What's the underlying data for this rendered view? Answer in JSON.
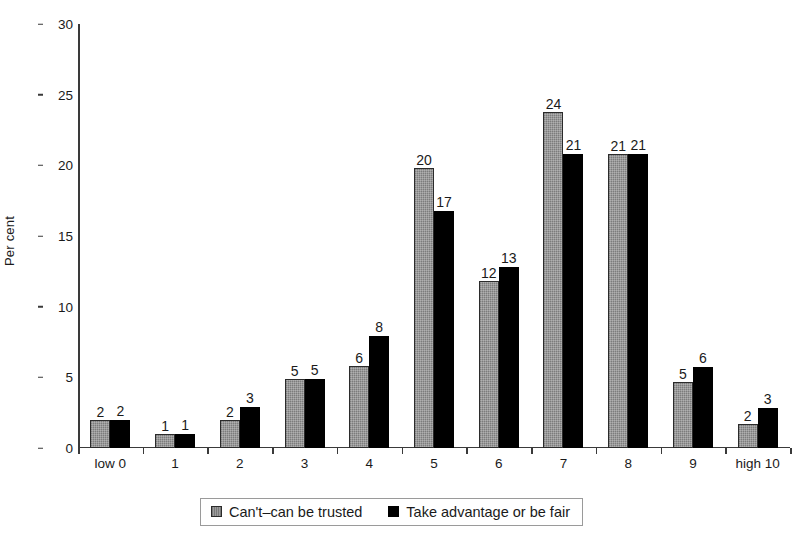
{
  "chart_data": {
    "type": "bar",
    "title": "",
    "subtitle": "",
    "xlabel": "",
    "ylabel": "Per cent",
    "categories": [
      "low 0",
      "1",
      "2",
      "3",
      "4",
      "5",
      "6",
      "7",
      "8",
      "9",
      "high 10"
    ],
    "series": [
      {
        "name": "Can't–can be trusted",
        "color": "#8e8e8e",
        "values": [
          2,
          1,
          2,
          5,
          6,
          20,
          12,
          24,
          21,
          5,
          2
        ],
        "plotted": [
          2.0,
          1.0,
          2.0,
          4.9,
          5.8,
          19.8,
          11.8,
          23.8,
          20.8,
          4.7,
          1.7
        ]
      },
      {
        "name": "Take advantage or be fair",
        "color": "#000000",
        "values": [
          2,
          1,
          3,
          5,
          8,
          17,
          13,
          21,
          21,
          6,
          3
        ],
        "plotted": [
          2.0,
          1.0,
          2.9,
          4.9,
          7.9,
          16.8,
          12.8,
          20.8,
          20.8,
          5.7,
          2.8
        ]
      }
    ],
    "ylim": [
      0,
      30
    ],
    "yticks": [
      0,
      5,
      10,
      15,
      20,
      25,
      30
    ],
    "ytick_labels": [
      "0",
      "5",
      "10",
      "15",
      "20",
      "25",
      "30"
    ],
    "grid": false,
    "legend_position": "bottom",
    "value_labels": true
  },
  "legend": {
    "items": [
      {
        "label": "Can't–can be trusted",
        "swatch": "gray-hatched-swatch"
      },
      {
        "label": "Take advantage or be fair",
        "swatch": "black-swatch"
      }
    ]
  },
  "colors": {
    "series_a": "#8e8e8e",
    "series_b": "#000000",
    "axis": "#3a3a3a",
    "text": "#1a1a1a",
    "background": "#ffffff",
    "legend_border": "#9a9a9a"
  }
}
